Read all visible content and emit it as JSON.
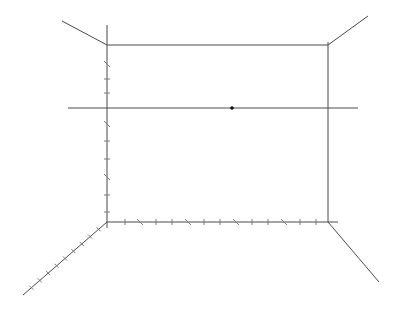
{
  "drawing": {
    "type": "one-point-perspective-grid",
    "colors": {
      "line": "#4a4a4a",
      "tick": "#7a7a7a",
      "vanishing_point": "#111111",
      "background": "#ffffff"
    },
    "back_wall": {
      "top_left": [
        107,
        45
      ],
      "top_right": [
        328,
        45
      ],
      "bottom_left": [
        107,
        222
      ],
      "bottom_right": [
        328,
        222
      ]
    },
    "horizon_line": {
      "y": 108,
      "x_start": 68,
      "x_end": 358
    },
    "vanishing_point": [
      232,
      108
    ],
    "left_vertical_extension": {
      "x": 107,
      "y_start": 25,
      "y_end": 228
    },
    "orthogonals": [
      {
        "name": "top-left",
        "from": [
          107,
          45
        ],
        "to": [
          62,
          21
        ]
      },
      {
        "name": "top-right",
        "from": [
          328,
          45
        ],
        "to": [
          368,
          16
        ]
      },
      {
        "name": "bottom-left",
        "from": [
          107,
          222
        ],
        "to": [
          23,
          295
        ]
      },
      {
        "name": "bottom-right",
        "from": [
          328,
          222
        ],
        "to": [
          379,
          282
        ]
      }
    ],
    "left_edge_ticks_y": [
      64,
      79,
      93,
      124,
      141,
      159,
      177,
      195,
      212
    ],
    "bottom_edge_ticks_x": [
      125,
      140,
      156,
      172,
      188,
      204,
      220,
      236,
      252,
      268,
      284,
      300,
      316
    ],
    "bottom_left_diagonal_ticks": 9
  }
}
